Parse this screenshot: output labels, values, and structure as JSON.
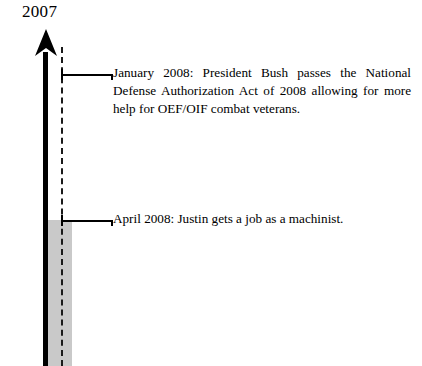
{
  "figure": {
    "type": "vertical-timeline",
    "era_label": "2007",
    "background_color": "#ffffff",
    "axis_color": "#000000",
    "band_color": "#c9c9c9",
    "guide_style": "dashed"
  },
  "events": [
    {
      "id": "jan-2008",
      "date_label": "January 2008:",
      "text": "January 2008:  President Bush passes the Na­tional Defense Authorization Act of 2008 allow­ing for more help for OEF/OIF combat veterans.",
      "lines": [
        "January 2008:  President Bush passes the Na-",
        "tional Defense Authorization Act of 2008 allow-",
        "ing for more help for OEF/OIF combat",
        "veterans."
      ]
    },
    {
      "id": "apr-2008",
      "date_label": "April 2008:",
      "text": "April 2008:  Justin gets a job as a machinist.",
      "lines": [
        "April 2008:  Justin gets a job as a machinist."
      ]
    }
  ]
}
